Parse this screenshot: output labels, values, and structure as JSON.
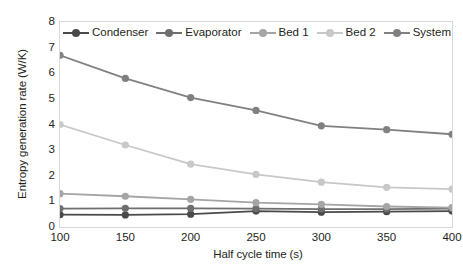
{
  "chart_data": {
    "type": "line",
    "title": "",
    "xlabel": "Half cycle time (s)",
    "ylabel": "Entropy generation rate (W/K)",
    "x": [
      100,
      150,
      200,
      250,
      300,
      350,
      400
    ],
    "xlim": [
      100,
      400
    ],
    "ylim": [
      0,
      8
    ],
    "xticks": [
      "100",
      "150",
      "200",
      "250",
      "300",
      "350",
      "400"
    ],
    "yticks": [
      "0",
      "1",
      "2",
      "3",
      "4",
      "5",
      "6",
      "7",
      "8"
    ],
    "grid": false,
    "legend_position": "top-inside",
    "series": [
      {
        "name": "Condenser",
        "color": "#4a4a4a",
        "values": [
          0.48,
          0.47,
          0.5,
          0.62,
          0.58,
          0.6,
          0.62
        ]
      },
      {
        "name": "Evaporator",
        "color": "#6e6e6e",
        "values": [
          0.72,
          0.73,
          0.73,
          0.72,
          0.7,
          0.7,
          0.72
        ]
      },
      {
        "name": "Bed 1",
        "color": "#a5a5a5",
        "values": [
          1.3,
          1.2,
          1.08,
          0.95,
          0.88,
          0.8,
          0.76
        ]
      },
      {
        "name": "Bed 2",
        "color": "#c8c8c8",
        "values": [
          4.0,
          3.2,
          2.45,
          2.05,
          1.75,
          1.55,
          1.48
        ]
      },
      {
        "name": "System",
        "color": "#808080",
        "values": [
          6.7,
          5.8,
          5.05,
          4.55,
          3.95,
          3.8,
          3.62
        ]
      }
    ]
  }
}
